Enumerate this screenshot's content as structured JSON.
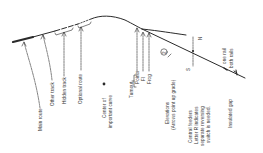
{
  "colors": {
    "ink": "#2a2a2a",
    "background": "#ffffff"
  },
  "labels": {
    "main_route": "Main route",
    "other_track": "Other track",
    "hidden_track": "Hidden track",
    "optional_route": "Optional route",
    "center_curve_1": "Center of",
    "center_curve_2": "important curve",
    "turnout": "Turnout",
    "points": "Points",
    "fl": "Fl",
    "frog": "Frog",
    "elevations_1": "Elevations",
    "elevations_2": "(Arrows point up grade)",
    "feeders_1": "Central feeders",
    "feeders_2": "Letter R indicates",
    "feeders_3": "separate reversing",
    "feeders_4": "switch is needed.",
    "insulated_gap": "Insulated gap",
    "one_rail": "one rail",
    "both_rails": "both rails",
    "elevation_marker": "2",
    "north": "N",
    "south": "S"
  }
}
